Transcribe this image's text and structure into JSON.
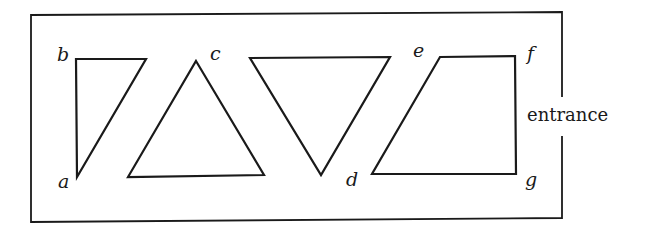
{
  "diagram": {
    "entrance_label": "entrance",
    "vertex_labels": {
      "a": "a",
      "b": "b",
      "c": "c",
      "d": "d",
      "e": "e",
      "f": "f",
      "g": "g"
    },
    "shapes": [
      {
        "name": "right-triangle",
        "vertices": [
          "a",
          "b"
        ]
      },
      {
        "name": "upright-triangle",
        "vertices": [
          "c"
        ]
      },
      {
        "name": "inverted-triangle",
        "vertices": [
          "d"
        ]
      },
      {
        "name": "trapezoid",
        "vertices": [
          "e",
          "f",
          "g"
        ]
      }
    ]
  }
}
